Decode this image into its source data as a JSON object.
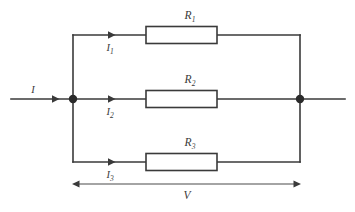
{
  "figure": {
    "background_color": "#ffffff",
    "line_color": "#3a3a3a",
    "node_color": "#2b2b2b"
  },
  "resistors": [
    {
      "name": "R1",
      "symbol": "R",
      "subscript": "1"
    },
    {
      "name": "R2",
      "symbol": "R",
      "subscript": "2"
    },
    {
      "name": "R3",
      "symbol": "R",
      "subscript": "3"
    }
  ],
  "currents": {
    "total": {
      "symbol": "I",
      "subscript": ""
    },
    "branches": [
      {
        "symbol": "I",
        "subscript": "1"
      },
      {
        "symbol": "I",
        "subscript": "2"
      },
      {
        "symbol": "I",
        "subscript": "3"
      }
    ]
  },
  "voltage": {
    "symbol": "V",
    "subscript": ""
  }
}
